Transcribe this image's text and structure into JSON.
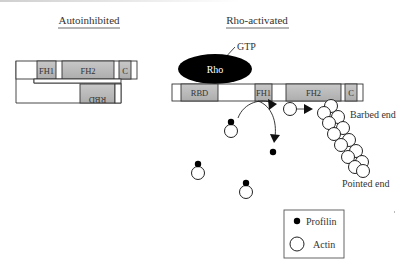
{
  "titles": {
    "autoinhibited": "Autoinhibited",
    "rho_activated": "Rho-activated"
  },
  "autoinhibited": {
    "domains": {
      "fh1": "FH1",
      "fh2": "FH2",
      "c": "C",
      "rbd": "RBD"
    }
  },
  "rho_activated": {
    "rho": "Rho",
    "gtp": "GTP",
    "domains": {
      "rbd": "RBD",
      "fh1": "FH1",
      "fh2": "FH2",
      "c": "C"
    },
    "barbed_end": "Barbed end",
    "pointed_end": "Pointed end"
  },
  "legend": {
    "profilin": "Profilin",
    "actin": "Actin"
  },
  "colors": {
    "domain_fill": "#b9b9b9",
    "outline": "#333333",
    "rho_fill": "#000000",
    "background": "#ffffff"
  }
}
